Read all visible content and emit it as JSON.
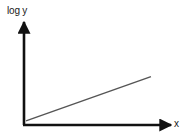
{
  "chart_data": {
    "type": "line",
    "title": "",
    "xlabel": "x",
    "ylabel": "log y",
    "grid": false,
    "legend": null,
    "ticks": {
      "x": [],
      "y": []
    },
    "series": [
      {
        "name": "log y vs x",
        "points_normalized": [
          {
            "x": 0.0,
            "y": 0.04
          },
          {
            "x": 0.85,
            "y": 0.47
          }
        ],
        "color": "#555555"
      }
    ],
    "axes_color": "#111111"
  },
  "labels": {
    "ylabel": "log y",
    "xlabel": "x"
  }
}
